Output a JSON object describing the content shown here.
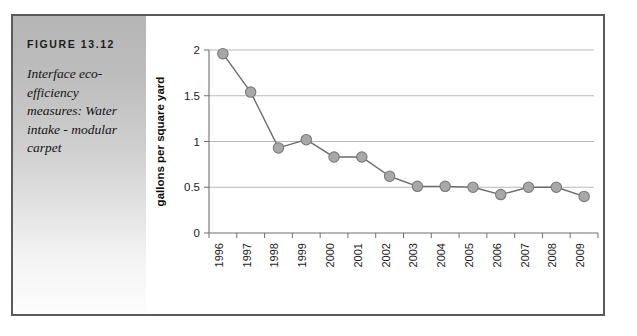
{
  "figure": {
    "label": "FIGURE 13.12",
    "caption": "Interface eco-efficiency measures: Water intake - modular carpet"
  },
  "colors": {
    "frame_border": "#5a5a5a",
    "panel_gradient_top": "#b5b5b5",
    "panel_gradient_bottom": "#fdfdfd",
    "grid_line": "#b9b9b9",
    "axis_line": "#6f6f6f",
    "series_line": "#6b6b6b",
    "marker_fill": "#a8a8a8",
    "marker_stroke": "#7a7a7a",
    "plot_background": "#ffffff"
  },
  "chart_data": {
    "type": "line",
    "title": "",
    "subtitle": "",
    "xlabel": "",
    "ylabel": "gallons per square yard",
    "categories": [
      "1996",
      "1997",
      "1998",
      "1999",
      "2000",
      "2001",
      "2002",
      "2003",
      "2004",
      "2005",
      "2006",
      "2007",
      "2008",
      "2009"
    ],
    "values": [
      1.96,
      1.54,
      0.93,
      1.02,
      0.83,
      0.83,
      0.62,
      0.51,
      0.51,
      0.5,
      0.42,
      0.5,
      0.5,
      0.4
    ],
    "ylim": [
      0,
      2
    ],
    "yticks": [
      0,
      0.5,
      1,
      1.5,
      2
    ],
    "ytick_labels": [
      "0",
      "0.5",
      "1",
      "1.5",
      "2"
    ],
    "grid": true,
    "grid_axis": "y",
    "legend": false,
    "legend_position": "none",
    "markers": true,
    "marker_shape": "circle",
    "xtick_rotation": -90
  }
}
